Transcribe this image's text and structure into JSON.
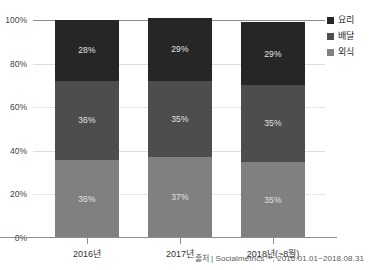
{
  "title_strip": "",
  "chart_data": {
    "type": "bar",
    "subtype": "stacked-percentage",
    "title": "",
    "xlabel": "",
    "ylabel": "",
    "ylim": [
      0,
      100
    ],
    "yticks": [
      "0%",
      "20%",
      "40%",
      "60%",
      "80%",
      "100%"
    ],
    "ytick_values": [
      0,
      20,
      40,
      60,
      80,
      100
    ],
    "grid": true,
    "legend_position": "right",
    "categories": [
      "2016년",
      "2017년",
      "2018년(~8월)"
    ],
    "series": [
      {
        "name": "요리",
        "color": "#262626",
        "values": [
          28,
          29,
          29
        ],
        "labels": [
          "28%",
          "29%",
          "29%"
        ]
      },
      {
        "name": "배달",
        "color": "#4d4d4d",
        "values": [
          36,
          35,
          35
        ],
        "labels": [
          "36%",
          "35%",
          "35%"
        ]
      },
      {
        "name": "외식",
        "color": "#808080",
        "values": [
          36,
          37,
          35
        ],
        "labels": [
          "36%",
          "37%",
          "35%"
        ]
      }
    ],
    "source_note": "출처 | Socialmetrics™, 2016.01.01~2018.08.31"
  },
  "legend": {
    "items": [
      {
        "label": "요리",
        "color": "#262626"
      },
      {
        "label": "배달",
        "color": "#4d4d4d"
      },
      {
        "label": "외식",
        "color": "#808080"
      }
    ]
  },
  "axes": {
    "y": {
      "ticks": [
        {
          "label": "100%",
          "value": 100
        },
        {
          "label": "80%",
          "value": 80
        },
        {
          "label": "60%",
          "value": 60
        },
        {
          "label": "40%",
          "value": 40
        },
        {
          "label": "20%",
          "value": 20
        },
        {
          "label": "0%",
          "value": 0
        }
      ]
    },
    "x": {
      "ticks": [
        {
          "label": "2016년"
        },
        {
          "label": "2017년"
        },
        {
          "label": "2018년(~8월)"
        }
      ]
    }
  },
  "source": "출처 | Socialmetrics™, 2016.01.01~2018.08.31"
}
